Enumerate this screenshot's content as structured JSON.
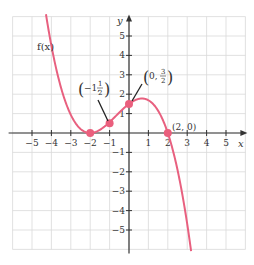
{
  "chart_data": {
    "type": "line",
    "title": "",
    "xlabel": "x",
    "ylabel": "y",
    "xlim": [
      -6,
      6
    ],
    "ylim": [
      -6,
      6
    ],
    "grid": true,
    "x_ticks": [
      -5,
      -4,
      -3,
      -2,
      -1,
      1,
      2,
      3,
      4,
      5
    ],
    "y_ticks": [
      -5,
      -4,
      -3,
      -2,
      -1,
      1,
      2,
      3,
      4,
      5
    ],
    "x_tick_labels": [
      "−5",
      "−4",
      "−3",
      "−2",
      "−1",
      "1",
      "2",
      "3",
      "4",
      "5"
    ],
    "y_tick_labels": [
      "−5",
      "−4",
      "−3",
      "−2",
      "−1",
      "1",
      "2",
      "3",
      "4",
      "5"
    ],
    "series": [
      {
        "name": "f(x)",
        "expression": "-(3/16)(x+2)^2(x-2)",
        "color": "#e8607f"
      }
    ],
    "highlighted_points": [
      {
        "x": -2,
        "y": 0,
        "label": ""
      },
      {
        "x": -1,
        "y": 0.5,
        "label": "(-1, 1/2)"
      },
      {
        "x": 0,
        "y": 1.5,
        "label": "(0, 3/2)"
      },
      {
        "x": 2,
        "y": 0,
        "label": "(2, 0)"
      }
    ],
    "function_label": "f(x)"
  },
  "labels": {
    "x_axis": "x",
    "y_axis": "y",
    "function": "f(x)",
    "point_a_prefix": "−1,",
    "point_a_num": "1",
    "point_a_den": "2",
    "point_b_prefix": "0,",
    "point_b_num": "3",
    "point_b_den": "2",
    "point_c": "(2, 0)"
  },
  "colors": {
    "curve": "#e8607f",
    "point": "#ea5f7d",
    "grid": "#d9d9d9",
    "axis": "#333333"
  }
}
